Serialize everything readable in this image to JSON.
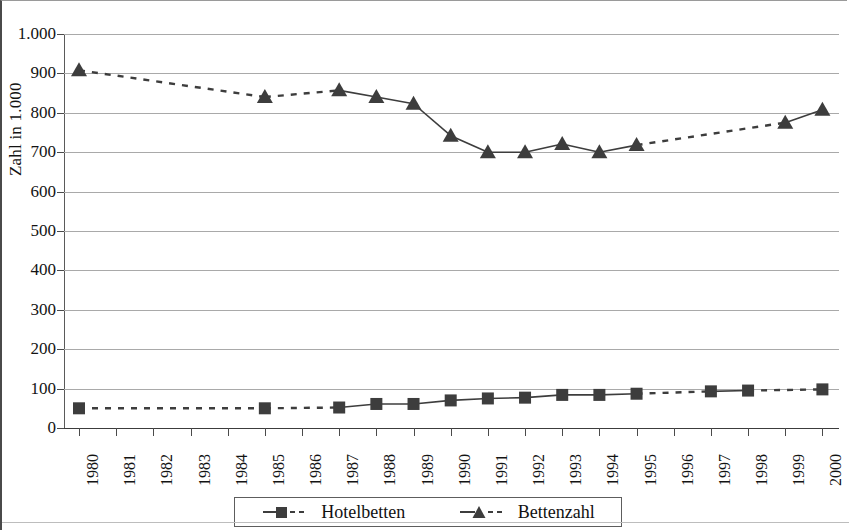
{
  "chart_data": {
    "type": "line",
    "title": "",
    "subtitle": "",
    "xlabel": "",
    "ylabel": "Zahl in 1.000",
    "categories": [
      "1980",
      "1981",
      "1982",
      "1983",
      "1984",
      "1985",
      "1986",
      "1987",
      "1988",
      "1989",
      "1990",
      "1991",
      "1992",
      "1993",
      "1994",
      "1995",
      "1996",
      "1997",
      "1998",
      "1999",
      "2000"
    ],
    "ylim": [
      0,
      1000
    ],
    "ytick_values": [
      0,
      100,
      200,
      300,
      400,
      500,
      600,
      700,
      800,
      900,
      1000
    ],
    "ytick_labels": [
      "0",
      "100",
      "200",
      "300",
      "400",
      "500",
      "600",
      "700",
      "800",
      "900",
      "1.000"
    ],
    "grid": true,
    "legend_position": "bottom",
    "series": [
      {
        "name": "Hotelbetten",
        "marker": "square",
        "line_style": "dashed",
        "color": "#3d3d3d",
        "values": [
          50,
          null,
          null,
          null,
          null,
          50,
          null,
          52,
          61,
          61,
          70,
          75,
          77,
          84,
          84,
          87,
          null,
          93,
          95,
          null,
          98
        ],
        "marker_years": [
          "1980",
          "1985",
          "1987",
          "1988",
          "1989",
          "1990",
          "1991",
          "1992",
          "1993",
          "1994",
          "1995",
          "1997",
          "1998",
          "2000"
        ]
      },
      {
        "name": "Bettenzahl",
        "marker": "triangle",
        "line_style": "dashed",
        "color": "#3d3d3d",
        "values": [
          908,
          null,
          null,
          null,
          null,
          840,
          null,
          857,
          840,
          823,
          742,
          700,
          700,
          721,
          700,
          718,
          null,
          null,
          null,
          775,
          808
        ],
        "marker_years": [
          "1980",
          "1985",
          "1987",
          "1988",
          "1989",
          "1990",
          "1991",
          "1992",
          "1993",
          "1994",
          "1995",
          "1999",
          "2000"
        ]
      }
    ]
  },
  "legend": {
    "items": [
      {
        "label": "Hotelbetten",
        "marker": "square"
      },
      {
        "label": "Bettenzahl",
        "marker": "triangle"
      }
    ]
  }
}
